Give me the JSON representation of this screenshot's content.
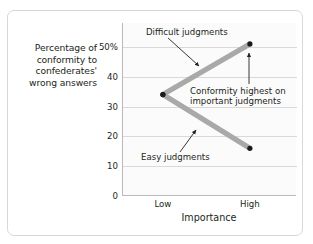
{
  "chart_data": {
    "type": "line",
    "title": "",
    "xlabel": "Importance",
    "ylabel": "Percentage of conformity to confederates' wrong answers",
    "categories": [
      "Low",
      "High"
    ],
    "x_tick_labels": [
      "Low",
      "High"
    ],
    "y_tick_labels": [
      "0",
      "10",
      "20",
      "30",
      "40",
      "50%"
    ],
    "y_tick_values": [
      0,
      10,
      20,
      30,
      40,
      50
    ],
    "ylim": [
      0,
      58
    ],
    "grid": true,
    "legend": "none",
    "series": [
      {
        "name": "Difficult judgments",
        "values": [
          34,
          51
        ],
        "color": "#a9a9a9"
      },
      {
        "name": "Easy judgments",
        "values": [
          34,
          16
        ],
        "color": "#a9a9a9"
      }
    ],
    "annotations": [
      {
        "id": "difficult-label",
        "text": "Difficult judgments",
        "points_to": "difficult-judgments-line"
      },
      {
        "id": "easy-label",
        "text": "Easy judgments",
        "points_to": "easy-judgments-line"
      },
      {
        "id": "highest-callout",
        "text": "Conformity highest on important judgments",
        "line1": "Conformity highest on",
        "line2": "important judgments",
        "points_to": "difficult-high-point"
      }
    ]
  },
  "axis": {
    "y_title_line1": "Percentage of",
    "y_title_line2": "conformity to",
    "y_title_line3": "confederates'",
    "y_title_line4": "wrong answers",
    "x_title": "Importance"
  },
  "colors": {
    "line": "#a9a9a9",
    "marker": "#1a1a1a",
    "grid": "#d9d9d9",
    "axis": "#b9b9b9",
    "frame": "#d8d8d8",
    "text": "#231f20",
    "plot_background": "#fbfbfb",
    "page_background": "#ffffff"
  }
}
